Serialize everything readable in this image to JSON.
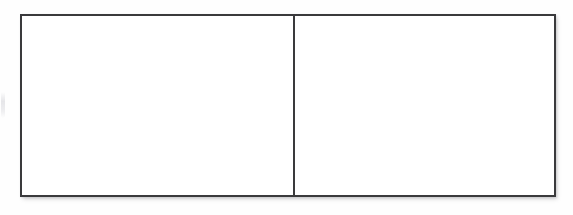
{
  "page": {
    "background_color": "#fefefe",
    "width": 573,
    "height": 215
  },
  "table": {
    "name": "two-cell-table",
    "border_color": "#3a3a3c",
    "border_width_px": 2,
    "fill_color": "#ffffff",
    "has_shadow": true,
    "columns": 2,
    "rows": 1,
    "cells": [
      {
        "position": "left",
        "text": "",
        "width_px": 273
      },
      {
        "position": "right",
        "text": "",
        "width_px": 263
      }
    ]
  },
  "artifacts": {
    "left_margin_mark": {
      "name": "scan-artifact",
      "color": "#dddde1",
      "text": ""
    }
  }
}
